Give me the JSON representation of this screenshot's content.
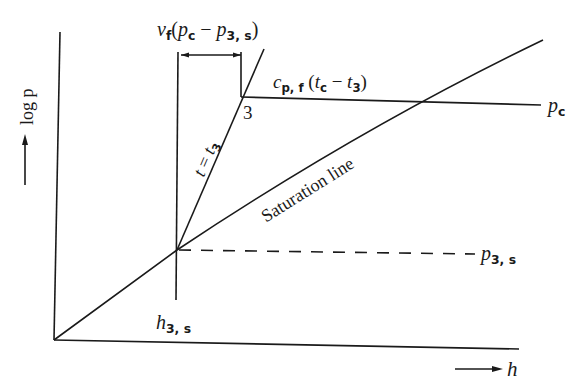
{
  "diagram": {
    "type": "log p - h diagram",
    "axes": {
      "y_label": "log p",
      "x_label": "h"
    },
    "labels": {
      "top_expr": {
        "v": "v",
        "v_sub": "f",
        "open": "(",
        "p1": "p",
        "p1_sub": "c",
        "minus": " − ",
        "p2": "p",
        "p2_sub": "3, s",
        "close": ")"
      },
      "cp_expr": {
        "c": "c",
        "c_sub": "p, f",
        "open": " (",
        "t1": "t",
        "t1_sub": "c",
        "minus": " − ",
        "t2": "t",
        "t2_sub": "3",
        "close": ")"
      },
      "point_3": "3",
      "isotherm": {
        "t": "t",
        "eq": " = ",
        "t3": "t",
        "t3_sub": "3"
      },
      "saturation_line": "Saturation line",
      "p_c": {
        "p": "p",
        "sub": "c"
      },
      "p_3s": {
        "p": "p",
        "sub": "3, s"
      },
      "h_3s": {
        "h": "h",
        "sub": "3, s"
      }
    },
    "colors": {
      "ink": "#1a1a1a",
      "background": "#ffffff"
    }
  }
}
